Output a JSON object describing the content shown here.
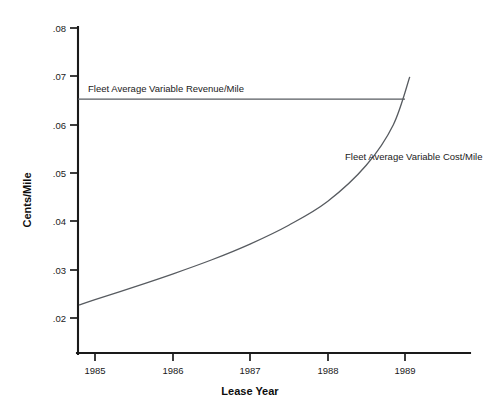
{
  "chart_data": {
    "type": "line",
    "title": "",
    "xlabel": "Lease Year",
    "ylabel": "Cents/Mile",
    "xlim": [
      1984.78,
      1989.85
    ],
    "ylim": [
      0.0128,
      0.08
    ],
    "grid": false,
    "legend_position": "inline-annotation",
    "x_ticks": [
      "1985",
      "1986",
      "1987",
      "1988",
      "1989"
    ],
    "x_tick_values": [
      1985,
      1986,
      1987,
      1988,
      1989
    ],
    "y_ticks": [
      ".08",
      ".07",
      ".06",
      ".05",
      ".04",
      ".03",
      ".02"
    ],
    "y_tick_values": [
      0.08,
      0.07,
      0.06,
      0.05,
      0.04,
      0.03,
      0.02
    ],
    "series": [
      {
        "name": "Fleet Average Variable Revenue/Mile",
        "label": "Fleet Average Variable Revenue/Mile",
        "shape": "horizontal-line",
        "x": [
          1984.78,
          1989.0
        ],
        "values": [
          0.0653,
          0.0653
        ]
      },
      {
        "name": "Fleet Average Variable Cost/Mile",
        "label": "Fleet Average Variable Cost/Mile",
        "shape": "exponential-curve",
        "x": [
          1984.8,
          1985.0,
          1985.5,
          1986.0,
          1986.5,
          1987.0,
          1987.5,
          1988.0,
          1988.5,
          1988.85,
          1989.06
        ],
        "values": [
          0.0227,
          0.0238,
          0.0264,
          0.0291,
          0.032,
          0.0353,
          0.0392,
          0.0441,
          0.0516,
          0.06,
          0.0698
        ]
      }
    ],
    "annotations": [
      {
        "name": "revenue-series-annotation",
        "text": "Fleet Average Variable Revenue/Mile",
        "x": 1985.02,
        "y": 0.0676
      },
      {
        "name": "cost-series-annotation",
        "text": "Fleet Average Variable Cost/Mile",
        "x": 1988.42,
        "y": 0.0568
      }
    ],
    "intersection": {
      "x": 1988.93,
      "y": 0.0653
    }
  },
  "axes": {
    "y_axis_title": "Cents/Mile",
    "x_axis_title": "Lease Year"
  }
}
